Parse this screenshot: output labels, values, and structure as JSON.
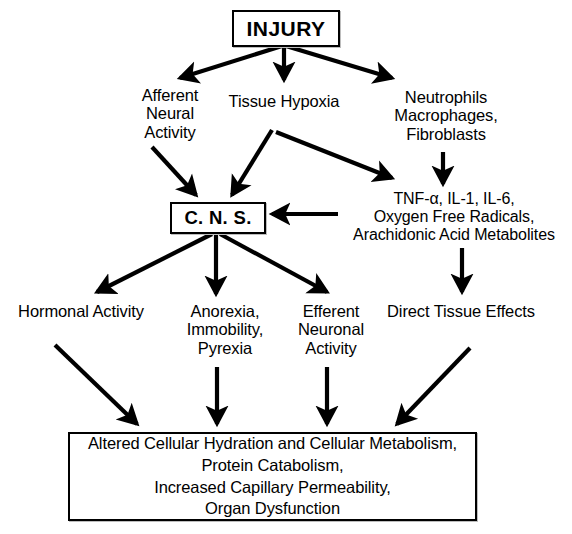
{
  "diagram": {
    "background_color": "#ffffff",
    "line_color": "#000000",
    "nodes": {
      "injury": {
        "label": "INJURY",
        "shape": "box"
      },
      "afferent": {
        "label": "Afferent\nNeural\nActivity",
        "shape": "plain"
      },
      "hypoxia": {
        "label": "Tissue Hypoxia",
        "shape": "plain"
      },
      "neutrophils": {
        "label": "Neutrophils\nMacrophages,\nFibroblasts",
        "shape": "plain"
      },
      "cns": {
        "label": "C. N. S.",
        "shape": "box"
      },
      "mediators": {
        "label": "TNF-α, IL-1, IL-6,\nOxygen Free Radicals,\nArachidonic Acid Metabolites",
        "shape": "plain"
      },
      "hormonal": {
        "label": "Hormonal Activity",
        "shape": "plain"
      },
      "anorexia": {
        "label": "Anorexia,\nImmobility,\nPyrexia",
        "shape": "plain"
      },
      "efferent": {
        "label": "Efferent\nNeuronal\nActivity",
        "shape": "plain"
      },
      "direct": {
        "label": "Direct Tissue Effects",
        "shape": "plain"
      },
      "outcome": {
        "label": "Altered Cellular Hydration and Cellular Metabolism,\nProtein Catabolism,\nIncreased Capillary Permeability,\nOrgan Dysfunction",
        "shape": "box"
      }
    },
    "edges": [
      {
        "name": "injury-to-afferent",
        "from": "injury",
        "to": "afferent"
      },
      {
        "name": "injury-to-hypoxia",
        "from": "injury",
        "to": "hypoxia"
      },
      {
        "name": "injury-to-neutrophils",
        "from": "injury",
        "to": "neutrophils"
      },
      {
        "name": "afferent-to-cns",
        "from": "afferent",
        "to": "cns"
      },
      {
        "name": "hypoxia-to-cns",
        "from": "hypoxia",
        "to": "cns"
      },
      {
        "name": "hypoxia-to-mediators",
        "from": "hypoxia",
        "to": "mediators"
      },
      {
        "name": "neutrophils-to-mediators",
        "from": "neutrophils",
        "to": "mediators"
      },
      {
        "name": "mediators-to-cns",
        "from": "mediators",
        "to": "cns"
      },
      {
        "name": "cns-to-hormonal",
        "from": "cns",
        "to": "hormonal"
      },
      {
        "name": "cns-to-anorexia",
        "from": "cns",
        "to": "anorexia"
      },
      {
        "name": "cns-to-efferent",
        "from": "cns",
        "to": "efferent"
      },
      {
        "name": "mediators-to-direct",
        "from": "mediators",
        "to": "direct"
      },
      {
        "name": "hormonal-to-outcome",
        "from": "hormonal",
        "to": "outcome"
      },
      {
        "name": "anorexia-to-outcome",
        "from": "anorexia",
        "to": "outcome"
      },
      {
        "name": "efferent-to-outcome",
        "from": "efferent",
        "to": "outcome"
      },
      {
        "name": "direct-to-outcome",
        "from": "direct",
        "to": "outcome"
      }
    ]
  }
}
